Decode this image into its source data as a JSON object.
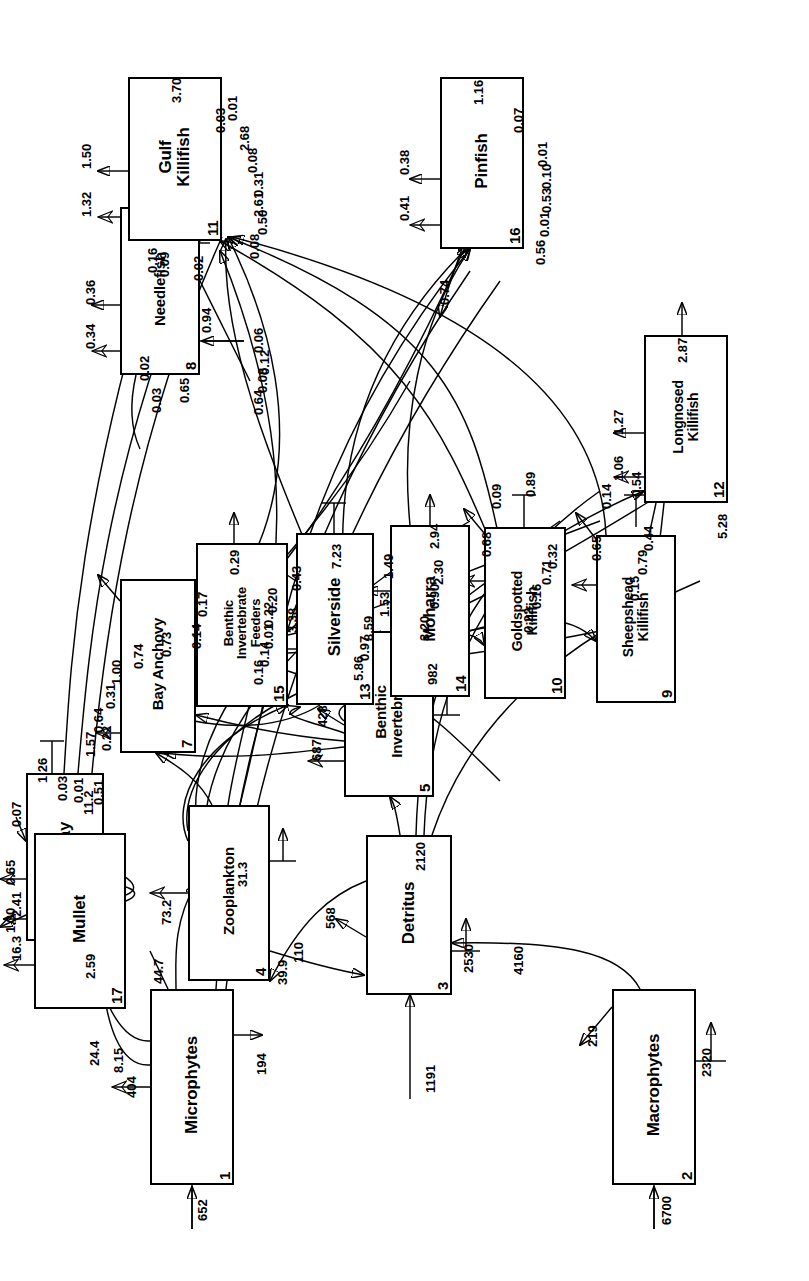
{
  "figure": {
    "orientation": "rotated-90-ccw",
    "units": "flows in mg C m-2 d-1"
  },
  "nodes": [
    {
      "id": "1",
      "name": "Microphytes",
      "x": 96,
      "y": 150,
      "w": 196,
      "h": 84,
      "font": "f17"
    },
    {
      "id": "2",
      "name": "Macrophytes",
      "x": 96,
      "y": 612,
      "w": 196,
      "h": 84,
      "font": "f17"
    },
    {
      "id": "3",
      "name": "Detritus",
      "x": 286,
      "y": 366,
      "w": 160,
      "h": 86,
      "font": "f17"
    },
    {
      "id": "4",
      "name": "Zooplankton",
      "x": 300,
      "y": 188,
      "w": 176,
      "h": 82,
      "font": "f15"
    },
    {
      "id": "5",
      "name": "Benthic\nInvertebrates",
      "x": 484,
      "y": 344,
      "w": 166,
      "h": 90,
      "font": "f15"
    },
    {
      "id": "6",
      "name": "Stingray",
      "x": 340,
      "y": 26,
      "w": 168,
      "h": 78,
      "font": "f17"
    },
    {
      "id": "7",
      "name": "Bay Anchovy",
      "x": 528,
      "y": 120,
      "w": 174,
      "h": 76,
      "font": "f15"
    },
    {
      "id": "8",
      "name": "Needlefish",
      "x": 906,
      "y": 120,
      "w": 168,
      "h": 80,
      "font": "f15"
    },
    {
      "id": "9",
      "name": "Sheepshead\nKillifish",
      "x": 578,
      "y": 596,
      "w": 168,
      "h": 80,
      "font": "f14"
    },
    {
      "id": "10",
      "name": "Goldspotted\nKillifish",
      "x": 582,
      "y": 484,
      "w": 172,
      "h": 82,
      "font": "f14"
    },
    {
      "id": "11",
      "name": "Gulf\nKillifish",
      "x": 1040,
      "y": 128,
      "w": 164,
      "h": 94,
      "font": "f17"
    },
    {
      "id": "12",
      "name": "Longnosed\nKillifish",
      "x": 778,
      "y": 644,
      "w": 168,
      "h": 84,
      "font": "f14"
    },
    {
      "id": "13",
      "name": "Silverside",
      "x": 576,
      "y": 296,
      "w": 172,
      "h": 78,
      "font": "f17"
    },
    {
      "id": "14",
      "name": "Moharra",
      "x": 584,
      "y": 390,
      "w": 172,
      "h": 80,
      "font": "f17"
    },
    {
      "id": "15",
      "name": "Benthic\nInvertebrate\nFeeders",
      "x": 574,
      "y": 196,
      "w": 164,
      "h": 92,
      "font": "f13"
    },
    {
      "id": "16",
      "name": "Pinfish",
      "x": 1032,
      "y": 440,
      "w": 172,
      "h": 84,
      "font": "f17"
    },
    {
      "id": "17",
      "name": "Mullet",
      "x": 272,
      "y": 34,
      "w": 176,
      "h": 92,
      "font": "f17"
    }
  ],
  "flow_labels": [
    {
      "v": "652",
      "x": 60,
      "y": 196
    },
    {
      "v": "404",
      "x": 183,
      "y": 125
    },
    {
      "v": "194",
      "x": 206,
      "y": 255
    },
    {
      "v": "44.7",
      "x": 297,
      "y": 152
    },
    {
      "v": "24.4",
      "x": 215,
      "y": 88
    },
    {
      "v": "8.15",
      "x": 208,
      "y": 112
    },
    {
      "v": "16.3",
      "x": 320,
      "y": 10
    },
    {
      "v": "2.41",
      "x": 364,
      "y": 10
    },
    {
      "v": "11.2",
      "x": 466,
      "y": 82
    },
    {
      "v": "6700",
      "x": 56,
      "y": 660
    },
    {
      "v": "219",
      "x": 234,
      "y": 586
    },
    {
      "v": "2320",
      "x": 204,
      "y": 700
    },
    {
      "v": "4160",
      "x": 306,
      "y": 512
    },
    {
      "v": "1191",
      "x": 188,
      "y": 424
    },
    {
      "v": "568",
      "x": 352,
      "y": 324
    },
    {
      "v": "2530",
      "x": 308,
      "y": 462
    },
    {
      "v": "2120",
      "x": 410,
      "y": 414
    },
    {
      "v": "110",
      "x": 318,
      "y": 292
    },
    {
      "v": "39.9",
      "x": 296,
      "y": 276
    },
    {
      "v": "73.2",
      "x": 356,
      "y": 160
    },
    {
      "v": "31.3",
      "x": 394,
      "y": 236
    },
    {
      "v": "687",
      "x": 520,
      "y": 310
    },
    {
      "v": "982",
      "x": 596,
      "y": 426
    },
    {
      "v": "428",
      "x": 554,
      "y": 316
    },
    {
      "v": "1.30",
      "x": 348,
      "y": 4
    },
    {
      "v": "0.65",
      "x": 396,
      "y": 4
    },
    {
      "v": "0.07",
      "x": 454,
      "y": 10
    },
    {
      "v": "1.26",
      "x": 498,
      "y": 36
    },
    {
      "v": "2.59",
      "x": 302,
      "y": 84
    },
    {
      "v": "0.51",
      "x": 476,
      "y": 92
    },
    {
      "v": "0.01",
      "x": 478,
      "y": 72
    },
    {
      "v": "0.03",
      "x": 480,
      "y": 56
    },
    {
      "v": "1.57",
      "x": 524,
      "y": 84
    },
    {
      "v": "0.64",
      "x": 548,
      "y": 92
    },
    {
      "v": "0.31",
      "x": 572,
      "y": 104
    },
    {
      "v": "1.00",
      "x": 596,
      "y": 110
    },
    {
      "v": "0.22",
      "x": 530,
      "y": 100
    },
    {
      "v": "0.74",
      "x": 612,
      "y": 132
    },
    {
      "v": "0.73",
      "x": 624,
      "y": 160
    },
    {
      "v": "0.14",
      "x": 632,
      "y": 190
    },
    {
      "v": "0.17",
      "x": 664,
      "y": 196
    },
    {
      "v": "0.29",
      "x": 706,
      "y": 228
    },
    {
      "v": "0.16",
      "x": 596,
      "y": 252
    },
    {
      "v": "0.14",
      "x": 614,
      "y": 258
    },
    {
      "v": "0.01",
      "x": 632,
      "y": 262
    },
    {
      "v": "0.22",
      "x": 654,
      "y": 262
    },
    {
      "v": "0.20",
      "x": 668,
      "y": 266
    },
    {
      "v": "3.38",
      "x": 648,
      "y": 286
    },
    {
      "v": "0.43",
      "x": 690,
      "y": 290
    },
    {
      "v": "7.23",
      "x": 712,
      "y": 330
    },
    {
      "v": "5.86",
      "x": 600,
      "y": 352
    },
    {
      "v": "0.97",
      "x": 620,
      "y": 358
    },
    {
      "v": "8.59",
      "x": 640,
      "y": 362
    },
    {
      "v": "1.53",
      "x": 664,
      "y": 378
    },
    {
      "v": "1.49",
      "x": 702,
      "y": 382
    },
    {
      "v": "2.94",
      "x": 732,
      "y": 428
    },
    {
      "v": "3.20",
      "x": 640,
      "y": 418
    },
    {
      "v": "0.90",
      "x": 672,
      "y": 428
    },
    {
      "v": "2.30",
      "x": 696,
      "y": 432
    },
    {
      "v": "0.68",
      "x": 724,
      "y": 480
    },
    {
      "v": "0.09",
      "x": 772,
      "y": 490
    },
    {
      "v": "0.89",
      "x": 784,
      "y": 524
    },
    {
      "v": "0.22",
      "x": 648,
      "y": 522
    },
    {
      "v": "0.16",
      "x": 672,
      "y": 530
    },
    {
      "v": "0.71",
      "x": 696,
      "y": 540
    },
    {
      "v": "0.32",
      "x": 712,
      "y": 546
    },
    {
      "v": "0.65",
      "x": 720,
      "y": 590
    },
    {
      "v": "0.14",
      "x": 772,
      "y": 600
    },
    {
      "v": "0.54",
      "x": 784,
      "y": 630
    },
    {
      "v": "0.15",
      "x": 680,
      "y": 628
    },
    {
      "v": "0.79",
      "x": 706,
      "y": 636
    },
    {
      "v": "0.44",
      "x": 730,
      "y": 642
    },
    {
      "v": "5.28",
      "x": 742,
      "y": 716
    },
    {
      "v": "1.06",
      "x": 800,
      "y": 612
    },
    {
      "v": "1.27",
      "x": 846,
      "y": 612
    },
    {
      "v": "2.87",
      "x": 918,
      "y": 676
    },
    {
      "v": "0.64",
      "x": 866,
      "y": 252
    },
    {
      "v": "0.08",
      "x": 888,
      "y": 256
    },
    {
      "v": "0.12",
      "x": 906,
      "y": 258
    },
    {
      "v": "0.06",
      "x": 928,
      "y": 252
    },
    {
      "v": "0.94",
      "x": 948,
      "y": 200
    },
    {
      "v": "0.34",
      "x": 932,
      "y": 84
    },
    {
      "v": "0.36",
      "x": 976,
      "y": 84
    },
    {
      "v": "0.02",
      "x": 900,
      "y": 138
    },
    {
      "v": "0.03",
      "x": 868,
      "y": 150
    },
    {
      "v": "0.65",
      "x": 878,
      "y": 178
    },
    {
      "v": "0.09",
      "x": 1004,
      "y": 158
    },
    {
      "v": "0.02",
      "x": 1000,
      "y": 192
    },
    {
      "v": "1.32",
      "x": 1064,
      "y": 80
    },
    {
      "v": "1.50",
      "x": 1112,
      "y": 80
    },
    {
      "v": "3.70",
      "x": 1178,
      "y": 170
    },
    {
      "v": "0.16",
      "x": 1008,
      "y": 146
    },
    {
      "v": "0.08",
      "x": 1022,
      "y": 248
    },
    {
      "v": "0.50",
      "x": 1046,
      "y": 256
    },
    {
      "v": "2.61",
      "x": 1064,
      "y": 252
    },
    {
      "v": "0.31",
      "x": 1084,
      "y": 252
    },
    {
      "v": "0.08",
      "x": 1108,
      "y": 246
    },
    {
      "v": "2.68",
      "x": 1130,
      "y": 238
    },
    {
      "v": "0.03",
      "x": 1148,
      "y": 214
    },
    {
      "v": "0.01",
      "x": 1160,
      "y": 226
    },
    {
      "v": "0.41",
      "x": 1060,
      "y": 398
    },
    {
      "v": "0.38",
      "x": 1106,
      "y": 398
    },
    {
      "v": "1.16",
      "x": 1176,
      "y": 472
    },
    {
      "v": "0.74",
      "x": 976,
      "y": 438
    },
    {
      "v": "0.56",
      "x": 1016,
      "y": 534
    },
    {
      "v": "0.01",
      "x": 1044,
      "y": 538
    },
    {
      "v": "0.53",
      "x": 1068,
      "y": 540
    },
    {
      "v": "0.10",
      "x": 1092,
      "y": 540
    },
    {
      "v": "0.01",
      "x": 1114,
      "y": 536
    },
    {
      "v": "0.07",
      "x": 1148,
      "y": 512
    }
  ],
  "edges_summary": {
    "description": "Directed carbon flows between numbered compartments",
    "flows": [
      {
        "from": "import",
        "to": "1",
        "value": 652
      },
      {
        "from": "1",
        "to": "export",
        "value": 404
      },
      {
        "from": "1",
        "to": "respiration",
        "value": 194
      },
      {
        "from": "1",
        "to": "17",
        "value": 24.4
      },
      {
        "from": "1",
        "to": "17",
        "value": 8.15
      },
      {
        "from": "1",
        "to": "4",
        "value": 44.7
      },
      {
        "from": "import",
        "to": "2",
        "value": 6700
      },
      {
        "from": "2",
        "to": "export",
        "value": 219
      },
      {
        "from": "2",
        "to": "respiration",
        "value": 2320
      },
      {
        "from": "2",
        "to": "3",
        "value": 4160
      },
      {
        "from": "import",
        "to": "3",
        "value": 1191
      },
      {
        "from": "3",
        "to": "export",
        "value": 568
      },
      {
        "from": "3",
        "to": "respiration",
        "value": 2530
      },
      {
        "from": "3",
        "to": "5",
        "value": 2120
      },
      {
        "from": "3",
        "to": "4",
        "value": 110
      },
      {
        "from": "4",
        "to": "3",
        "value": 39.9
      },
      {
        "from": "4",
        "to": "export",
        "value": 73.2
      },
      {
        "from": "4",
        "to": "respiration",
        "value": 31.3
      },
      {
        "from": "5",
        "to": "export",
        "value": 687
      },
      {
        "from": "5",
        "to": "respiration",
        "value": 982
      },
      {
        "from": "5",
        "to": "3",
        "value": 428
      },
      {
        "from": "17",
        "to": "export",
        "value": 16.3
      },
      {
        "from": "17",
        "to": "3",
        "value": 2.41
      },
      {
        "from": "17",
        "to": "respiration",
        "value": 11.2
      },
      {
        "from": "17",
        "to": "6",
        "value": 2.59
      },
      {
        "from": "6",
        "to": "export",
        "value": 1.3
      },
      {
        "from": "6",
        "to": "export",
        "value": 0.65
      },
      {
        "from": "6",
        "to": "respiration",
        "value": 1.26
      },
      {
        "from": "11",
        "to": "6",
        "value": 0.07
      },
      {
        "from": "7",
        "to": "export",
        "value": 0.22
      },
      {
        "from": "7",
        "to": "export",
        "value": 0.74
      },
      {
        "from": "7",
        "to": "respiration",
        "value": 0.73
      },
      {
        "from": "4",
        "to": "7",
        "value": 1.57
      },
      {
        "from": "5",
        "to": "7",
        "value": 0.64
      },
      {
        "from": "13",
        "to": "7",
        "value": 0.31
      },
      {
        "from": "15",
        "to": "7",
        "value": 1.0
      },
      {
        "from": "15",
        "to": "export",
        "value": 0.14
      },
      {
        "from": "15",
        "to": "export",
        "value": 0.17
      },
      {
        "from": "15",
        "to": "respiration",
        "value": 0.29
      },
      {
        "from": "13",
        "to": "export",
        "value": 3.38
      },
      {
        "from": "13",
        "to": "export",
        "value": 0.43
      },
      {
        "from": "13",
        "to": "respiration",
        "value": 7.23
      },
      {
        "from": "14",
        "to": "export",
        "value": 1.53
      },
      {
        "from": "14",
        "to": "export",
        "value": 1.49
      },
      {
        "from": "14",
        "to": "respiration",
        "value": 2.94
      },
      {
        "from": "10",
        "to": "export",
        "value": 0.68
      },
      {
        "from": "10",
        "to": "export",
        "value": 0.09
      },
      {
        "from": "10",
        "to": "respiration",
        "value": 0.89
      },
      {
        "from": "9",
        "to": "export",
        "value": 0.65
      },
      {
        "from": "9",
        "to": "export",
        "value": 0.14
      },
      {
        "from": "9",
        "to": "respiration",
        "value": 0.54
      },
      {
        "from": "5",
        "to": "12",
        "value": 5.28
      },
      {
        "from": "12",
        "to": "export",
        "value": 1.06
      },
      {
        "from": "12",
        "to": "export",
        "value": 1.27
      },
      {
        "from": "12",
        "to": "respiration",
        "value": 2.87
      },
      {
        "from": "8",
        "to": "export",
        "value": 0.34
      },
      {
        "from": "8",
        "to": "export",
        "value": 0.36
      },
      {
        "from": "8",
        "to": "respiration",
        "value": 0.94
      },
      {
        "from": "8",
        "to": "16",
        "value": 0.02
      },
      {
        "from": "16",
        "to": "8",
        "value": 0.09
      },
      {
        "from": "11",
        "to": "export",
        "value": 1.32
      },
      {
        "from": "11",
        "to": "export",
        "value": 1.5
      },
      {
        "from": "11",
        "to": "respiration",
        "value": 3.7
      },
      {
        "from": "16",
        "to": "export",
        "value": 0.41
      },
      {
        "from": "16",
        "to": "export",
        "value": 0.38
      },
      {
        "from": "16",
        "to": "respiration",
        "value": 1.16
      },
      {
        "from": "16",
        "to": "export",
        "value": 0.07
      }
    ]
  }
}
